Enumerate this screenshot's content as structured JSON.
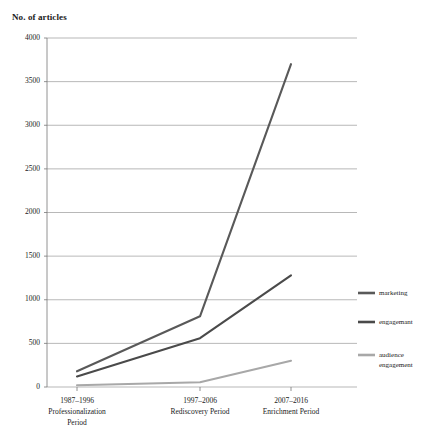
{
  "chart_data": {
    "type": "line",
    "title": "No. of articles",
    "xlabel": "",
    "ylabel": "No. of articles",
    "ylim": [
      0,
      4000
    ],
    "ytick_step": 500,
    "grid": true,
    "legend_position": "right",
    "categories": [
      "1987–1996 Professionalization Period",
      "1997–2006 Rediscovery Period",
      "2007–2016 Enrichment Period"
    ],
    "category_lines": [
      [
        "1987–1996",
        "Professionalization",
        "Period"
      ],
      [
        "1997–2006",
        "Rediscovery Period"
      ],
      [
        "2007–2016",
        "Enrichment Period"
      ]
    ],
    "yticks": [
      0,
      500,
      1000,
      1500,
      2000,
      2500,
      3000,
      3500,
      4000
    ],
    "ytick_labels": [
      "0",
      "500",
      "1000",
      "1500",
      "2000",
      "2500",
      "3000",
      "3500",
      "4000"
    ],
    "series": [
      {
        "name": "marketing",
        "values": [
          180,
          810,
          3700
        ],
        "color": "#595959"
      },
      {
        "name": "engagemant",
        "values": [
          120,
          560,
          1280
        ],
        "color": "#4a4a4a"
      },
      {
        "name": "audience engagement",
        "values": [
          20,
          55,
          300
        ],
        "color": "#a8a8a8"
      }
    ]
  },
  "legend": {
    "entries": [
      {
        "label": "marketing",
        "color": "#595959"
      },
      {
        "label": "engagemant",
        "color": "#4a4a4a"
      },
      {
        "label": "audience",
        "label2": "engagement",
        "color": "#a8a8a8"
      }
    ]
  }
}
